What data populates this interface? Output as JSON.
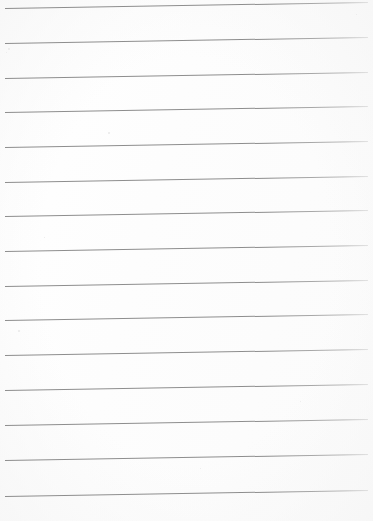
{
  "document": {
    "kind": "scanned-lined-paper",
    "title": "Blank ruled paper scan",
    "page_width": 373,
    "page_height": 521,
    "background_color": "#fefefe",
    "paper_tint": "#fbfbfb",
    "has_text": false,
    "has_margin_rule": false,
    "visible_text": ""
  },
  "ruling": {
    "line_color": "#8d8d8d",
    "line_color_faded": "#b9b9b9",
    "line_count": 15,
    "line_thickness_px": 1.2,
    "left_x": 5,
    "right_x": 368,
    "line_length_px": 363,
    "spacing_px": 34.8,
    "tilt_degrees": -0.95,
    "first_line_y": 8,
    "last_line_y": 496,
    "lines": [
      {
        "index": 1,
        "x1": 5,
        "y1": 8,
        "x2": 368,
        "y2": 2
      },
      {
        "index": 2,
        "x1": 5,
        "y1": 43,
        "x2": 368,
        "y2": 37
      },
      {
        "index": 3,
        "x1": 5,
        "y1": 78,
        "x2": 368,
        "y2": 72
      },
      {
        "index": 4,
        "x1": 5,
        "y1": 112,
        "x2": 368,
        "y2": 106
      },
      {
        "index": 5,
        "x1": 5,
        "y1": 147,
        "x2": 368,
        "y2": 141
      },
      {
        "index": 6,
        "x1": 5,
        "y1": 182,
        "x2": 368,
        "y2": 176
      },
      {
        "index": 7,
        "x1": 5,
        "y1": 216,
        "x2": 368,
        "y2": 210
      },
      {
        "index": 8,
        "x1": 5,
        "y1": 251,
        "x2": 368,
        "y2": 245
      },
      {
        "index": 9,
        "x1": 5,
        "y1": 286,
        "x2": 368,
        "y2": 280
      },
      {
        "index": 10,
        "x1": 5,
        "y1": 320,
        "x2": 368,
        "y2": 314
      },
      {
        "index": 11,
        "x1": 5,
        "y1": 355,
        "x2": 368,
        "y2": 349
      },
      {
        "index": 12,
        "x1": 5,
        "y1": 390,
        "x2": 368,
        "y2": 384
      },
      {
        "index": 13,
        "x1": 5,
        "y1": 425,
        "x2": 368,
        "y2": 419
      },
      {
        "index": 14,
        "x1": 5,
        "y1": 460,
        "x2": 368,
        "y2": 454
      },
      {
        "index": 15,
        "x1": 5,
        "y1": 496,
        "x2": 368,
        "y2": 490
      }
    ]
  },
  "scan_artifacts": {
    "specks": [
      {
        "x": 108,
        "y": 132,
        "size": 2
      },
      {
        "x": 8,
        "y": 48,
        "size": 2
      },
      {
        "x": 6,
        "y": 52,
        "size": 1
      },
      {
        "x": 18,
        "y": 330,
        "size": 2
      },
      {
        "x": 356,
        "y": 14,
        "size": 1
      },
      {
        "x": 200,
        "y": 468,
        "size": 1
      },
      {
        "x": 44,
        "y": 237,
        "size": 1
      },
      {
        "x": 300,
        "y": 401,
        "size": 1
      }
    ]
  }
}
